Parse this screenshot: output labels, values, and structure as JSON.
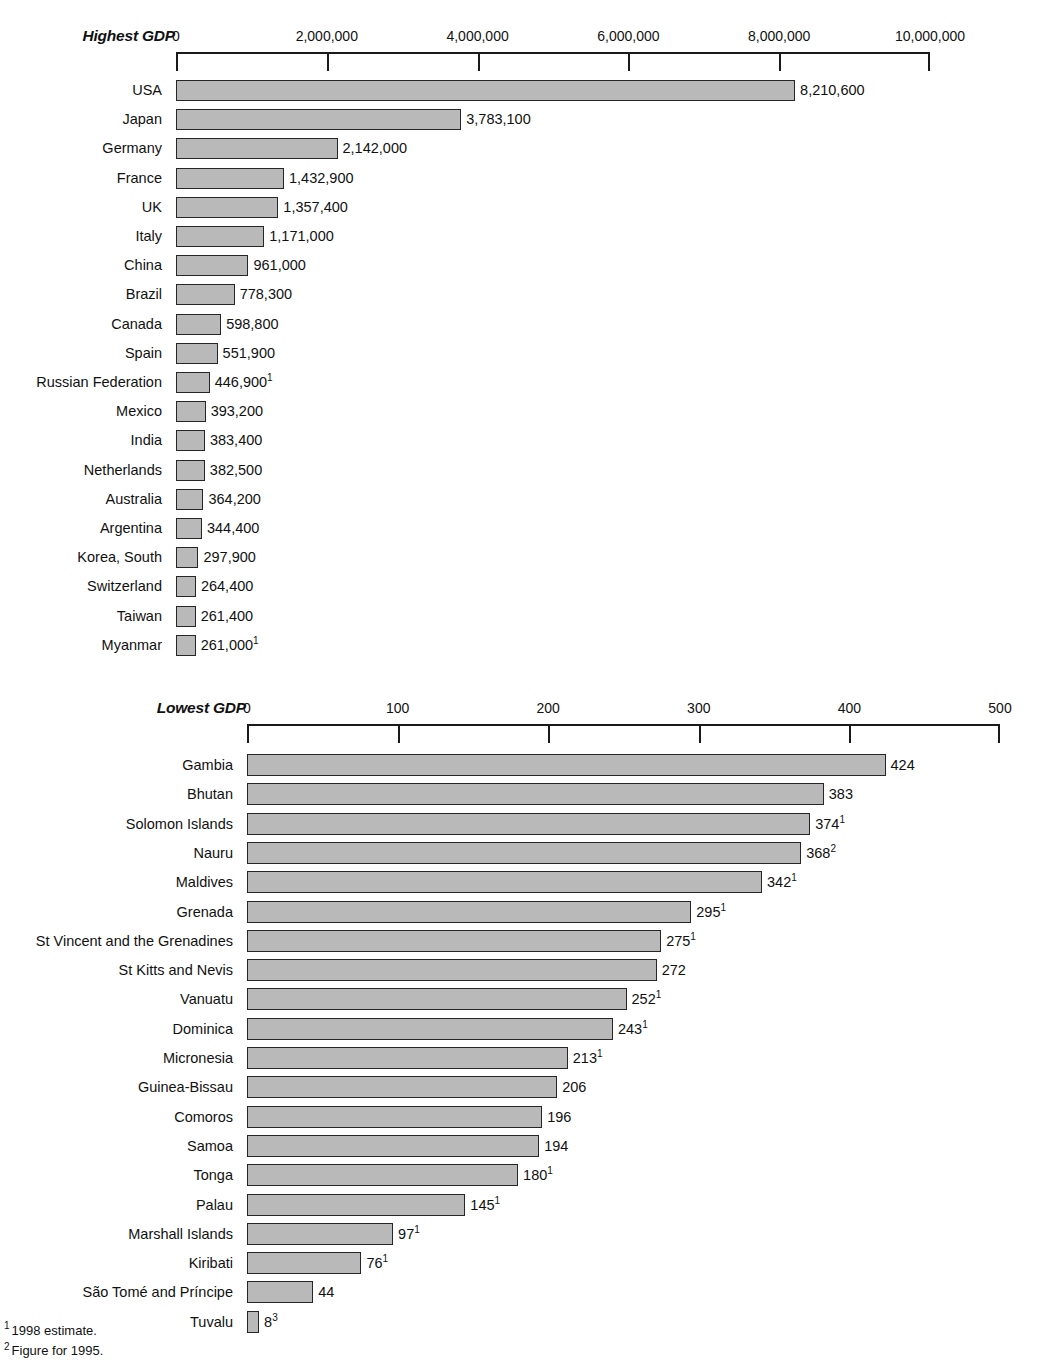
{
  "footnotes": [
    {
      "marker": "1",
      "text": "1998 estimate."
    },
    {
      "marker": "2",
      "text": "Figure for 1995."
    }
  ],
  "chart_data": [
    {
      "type": "bar",
      "title": "Highest GDP",
      "orientation": "horizontal",
      "xlabel": "",
      "ylabel": "",
      "xlim": [
        0,
        10000000
      ],
      "tick_labels": [
        "0",
        "2,000,000",
        "4,000,000",
        "6,000,000",
        "8,000,000",
        "10,000,000"
      ],
      "tick_values": [
        0,
        2000000,
        4000000,
        6000000,
        8000000,
        10000000
      ],
      "grid": false,
      "legend": "none",
      "categories": [
        "USA",
        "Japan",
        "Germany",
        "France",
        "UK",
        "Italy",
        "China",
        "Brazil",
        "Canada",
        "Spain",
        "Russian Federation",
        "Mexico",
        "India",
        "Netherlands",
        "Australia",
        "Argentina",
        "Korea, South",
        "Switzerland",
        "Taiwan",
        "Myanmar"
      ],
      "values": [
        8210600,
        3783100,
        2142000,
        1432900,
        1357400,
        1171000,
        961000,
        778300,
        598800,
        551900,
        446900,
        393200,
        383400,
        382500,
        364200,
        344400,
        297900,
        264400,
        261400,
        261000
      ],
      "value_labels": [
        "8,210,600",
        "3,783,100",
        "2,142,000",
        "1,432,900",
        "1,357,400",
        "1,171,000",
        "961,000",
        "778,300",
        "598,800",
        "551,900",
        "446,900",
        "393,200",
        "383,400",
        "382,500",
        "364,200",
        "344,400",
        "297,900",
        "264,400",
        "261,400",
        "261,000"
      ],
      "value_footnotes": [
        "",
        "",
        "",
        "",
        "",
        "",
        "",
        "",
        "",
        "",
        "1",
        "",
        "",
        "",
        "",
        "",
        "",
        "",
        "",
        "1"
      ]
    },
    {
      "type": "bar",
      "title": "Lowest GDP",
      "orientation": "horizontal",
      "xlabel": "",
      "ylabel": "",
      "xlim": [
        0,
        500
      ],
      "tick_labels": [
        "0",
        "100",
        "200",
        "300",
        "400",
        "500"
      ],
      "tick_values": [
        0,
        100,
        200,
        300,
        400,
        500
      ],
      "grid": false,
      "legend": "none",
      "categories": [
        "Gambia",
        "Bhutan",
        "Solomon Islands",
        "Nauru",
        "Maldives",
        "Grenada",
        "St Vincent and the Grenadines",
        "St Kitts and Nevis",
        "Vanuatu",
        "Dominica",
        "Micronesia",
        "Guinea-Bissau",
        "Comoros",
        "Samoa",
        "Tonga",
        "Palau",
        "Marshall Islands",
        "Kiribati",
        "São Tomé and Príncipe",
        "Tuvalu"
      ],
      "values": [
        424,
        383,
        374,
        368,
        342,
        295,
        275,
        272,
        252,
        243,
        213,
        206,
        196,
        194,
        180,
        145,
        97,
        76,
        44,
        8
      ],
      "value_labels": [
        "424",
        "383",
        "374",
        "368",
        "342",
        "295",
        "275",
        "272",
        "252",
        "243",
        "213",
        "206",
        "196",
        "194",
        "180",
        "145",
        "97",
        "76",
        "44",
        "8"
      ],
      "value_footnotes": [
        "",
        "",
        "1",
        "2",
        "1",
        "1",
        "1",
        "",
        "1",
        "1",
        "1",
        "",
        "",
        "",
        "1",
        "1",
        "1",
        "1",
        "",
        "3"
      ]
    }
  ]
}
